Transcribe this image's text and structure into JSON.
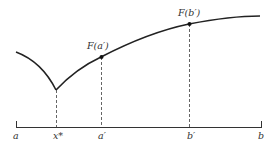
{
  "diagram": {
    "type": "function-curve-with-cusp",
    "colors": {
      "curve": "#222222",
      "axis": "#333333",
      "dashed": "#555555",
      "text": "#333333",
      "background": "#ffffff"
    },
    "point_labels": {
      "fa": "F(a′)",
      "fb": "F(b′)"
    },
    "axis_labels": {
      "a": "a",
      "xstar": "x*",
      "aprime": "a′",
      "bprime": "b′",
      "b": "b"
    }
  }
}
